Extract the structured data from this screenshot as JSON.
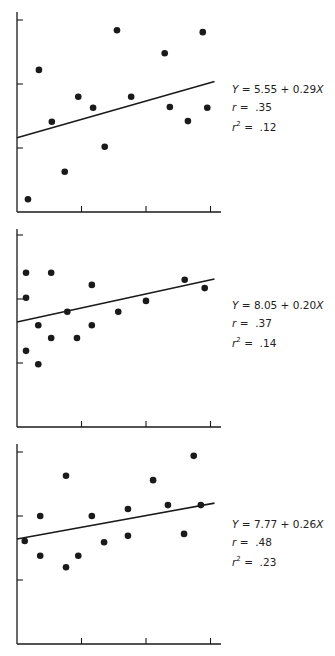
{
  "chart_data": [
    {
      "type": "scatter",
      "title": "",
      "xlabel": "",
      "ylabel": "",
      "note": "Axes have unlabeled ticks; values given in tick units (0-3 on each axis)",
      "xlim": [
        0,
        3.2
      ],
      "ylim": [
        0,
        3.1
      ],
      "x_ticks": [
        1,
        2,
        3
      ],
      "y_ticks": [
        1,
        2,
        3
      ],
      "grid": false,
      "points": [
        [
          0.17,
          0.2
        ],
        [
          0.34,
          2.22
        ],
        [
          0.54,
          1.41
        ],
        [
          0.74,
          0.63
        ],
        [
          0.95,
          1.8
        ],
        [
          1.18,
          1.63
        ],
        [
          1.36,
          1.02
        ],
        [
          1.55,
          2.84
        ],
        [
          1.77,
          1.8
        ],
        [
          2.29,
          2.48
        ],
        [
          2.37,
          1.64
        ],
        [
          2.65,
          1.42
        ],
        [
          2.88,
          2.81
        ],
        [
          2.95,
          1.63
        ]
      ],
      "regression_line": [
        [
          0,
          1.16
        ],
        [
          3.0,
          2.02
        ]
      ],
      "annotation": {
        "equation": "Y = 5.55 + 0.29X",
        "r": ".35",
        "r2": ".12"
      }
    },
    {
      "type": "scatter",
      "title": "",
      "xlabel": "",
      "ylabel": "",
      "note": "Axes have unlabeled ticks; values given in tick units (0-3 on each axis)",
      "xlim": [
        0,
        3.2
      ],
      "ylim": [
        0,
        3.1
      ],
      "x_ticks": [
        1,
        2,
        3
      ],
      "y_ticks": [
        1,
        2,
        3
      ],
      "grid": false,
      "points": [
        [
          0.14,
          2.41
        ],
        [
          0.14,
          2.02
        ],
        [
          0.53,
          2.41
        ],
        [
          1.16,
          2.22
        ],
        [
          0.33,
          1.59
        ],
        [
          0.78,
          1.8
        ],
        [
          0.14,
          1.19
        ],
        [
          0.33,
          0.98
        ],
        [
          0.53,
          1.39
        ],
        [
          0.93,
          1.39
        ],
        [
          1.16,
          1.59
        ],
        [
          1.57,
          1.8
        ],
        [
          2.0,
          1.97
        ],
        [
          2.6,
          2.3
        ],
        [
          2.91,
          2.17
        ]
      ],
      "regression_line": [
        [
          0,
          1.64
        ],
        [
          3.0,
          2.3
        ]
      ],
      "annotation": {
        "equation": "Y = 8.05 + 0.20X",
        "r": ".37",
        "r2": ".14"
      }
    },
    {
      "type": "scatter",
      "title": "",
      "xlabel": "",
      "ylabel": "",
      "note": "Axes have unlabeled ticks; values given in tick units (0-3 on each axis)",
      "xlim": [
        0,
        3.2
      ],
      "ylim": [
        0,
        3.1
      ],
      "x_ticks": [
        1,
        2,
        3
      ],
      "y_ticks": [
        1,
        2,
        3
      ],
      "grid": false,
      "points": [
        [
          0.12,
          1.61
        ],
        [
          0.36,
          2.0
        ],
        [
          0.36,
          1.38
        ],
        [
          0.76,
          2.63
        ],
        [
          0.76,
          1.2
        ],
        [
          0.95,
          1.38
        ],
        [
          1.16,
          2.0
        ],
        [
          1.35,
          1.59
        ],
        [
          1.72,
          2.11
        ],
        [
          1.72,
          1.69
        ],
        [
          2.11,
          2.56
        ],
        [
          2.34,
          2.17
        ],
        [
          2.59,
          1.72
        ],
        [
          2.74,
          2.94
        ],
        [
          2.85,
          2.17
        ]
      ],
      "regression_line": [
        [
          0,
          1.64
        ],
        [
          3.0,
          2.19
        ]
      ],
      "annotation": {
        "equation": "Y = 7.77 + 0.26X",
        "r": ".48",
        "r2": ".23"
      }
    }
  ],
  "panels": [
    {
      "equation_lhs": "Y",
      "equation_rhs": " = 5.55 + 0.29",
      "equation_var": "X",
      "r_label": "r",
      "r_eq": " =  ",
      "r_value": ".35",
      "r2_label": "r",
      "r2_sup": "2",
      "r2_eq": " =  ",
      "r2_value": ".12"
    },
    {
      "equation_lhs": "Y",
      "equation_rhs": " = 8.05 + 0.20",
      "equation_var": "X",
      "r_label": "r",
      "r_eq": " =  ",
      "r_value": ".37",
      "r2_label": "r",
      "r2_sup": "2",
      "r2_eq": " =  ",
      "r2_value": ".14"
    },
    {
      "equation_lhs": "Y",
      "equation_rhs": " = 7.77 + 0.26",
      "equation_var": "X",
      "r_label": "r",
      "r_eq": " =  ",
      "r_value": ".48",
      "r2_label": "r",
      "r2_sup": "2",
      "r2_eq": " =  ",
      "r2_value": ".23"
    }
  ],
  "colors": {
    "ink": "#1a1a1a",
    "background": "#ffffff"
  }
}
